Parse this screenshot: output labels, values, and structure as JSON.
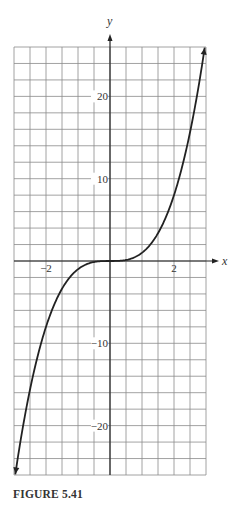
{
  "chart_data": {
    "type": "line",
    "title": "",
    "caption": "FIGURE 5.41",
    "xlabel": "x",
    "ylabel": "y",
    "xlim": [
      -3,
      3
    ],
    "ylim": [
      -26,
      26
    ],
    "grid": true,
    "grid_step": {
      "x": 0.5,
      "y": 2
    },
    "x_ticks_labeled": [
      {
        "value": -2,
        "label": "−2"
      },
      {
        "value": 2,
        "label": "2"
      }
    ],
    "y_ticks_labeled": [
      {
        "value": 20,
        "label": "20"
      },
      {
        "value": 10,
        "label": "10"
      },
      {
        "value": -10,
        "label": "−10"
      },
      {
        "value": -20,
        "label": "−20"
      }
    ],
    "series": [
      {
        "name": "y = x^3",
        "function": "x^3",
        "x": [
          -3,
          -2.5,
          -2,
          -1.5,
          -1,
          -0.5,
          0,
          0.5,
          1,
          1.5,
          2,
          2.5,
          3
        ],
        "values": [
          -27,
          -15.625,
          -8,
          -3.375,
          -1,
          -0.125,
          0,
          0.125,
          1,
          3.375,
          8,
          15.625,
          27
        ],
        "arrows_at_ends": true
      }
    ],
    "legend": null
  },
  "colors": {
    "grid": "#8a8a8a",
    "axis": "#222222",
    "curve": "#222222",
    "text": "#333333"
  }
}
